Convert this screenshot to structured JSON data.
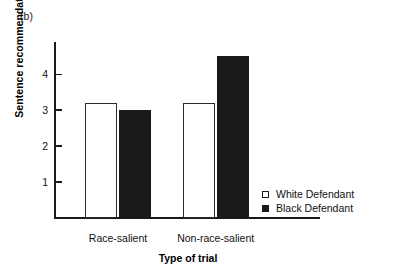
{
  "figure": {
    "panel_label": "(b)"
  },
  "chart_data": {
    "type": "bar",
    "title": "",
    "subtitle": "",
    "xlabel": "Type of trial",
    "ylabel": "Sentence recommendation",
    "categories": [
      "Race-salient",
      "Non-race-salient"
    ],
    "series": [
      {
        "name": "White Defendant",
        "values": [
          3.2,
          3.2
        ],
        "fill": "#ffffff",
        "edge": "#2b2b2b"
      },
      {
        "name": "Black Defendant",
        "values": [
          3.0,
          4.5
        ],
        "fill": "#1a1a1a",
        "edge": "#1a1a1a"
      }
    ],
    "ylim": [
      0,
      4.9
    ],
    "yticks": [
      1,
      2,
      3,
      4
    ],
    "ytick_labels": [
      "1",
      "2",
      "3",
      "4"
    ],
    "grid": false,
    "legend_position": "right-lower",
    "legend": [
      {
        "label": "White Defendant",
        "marker": "open-square"
      },
      {
        "label": "Black Defendant",
        "marker": "filled-square"
      }
    ]
  },
  "axis": {
    "y_tick_1": "1",
    "y_tick_2": "2",
    "y_tick_3": "3",
    "y_tick_4": "4"
  },
  "groups": {
    "g0": "Race-salient",
    "g1": "Non-race-salient"
  },
  "legend": {
    "white_label": "White Defendant",
    "black_label": "Black Defendant"
  },
  "colors": {
    "ink": "#1a1a1a",
    "white_bar": "#ffffff",
    "black_bar": "#1a1a1a",
    "background": "#ffffff"
  }
}
